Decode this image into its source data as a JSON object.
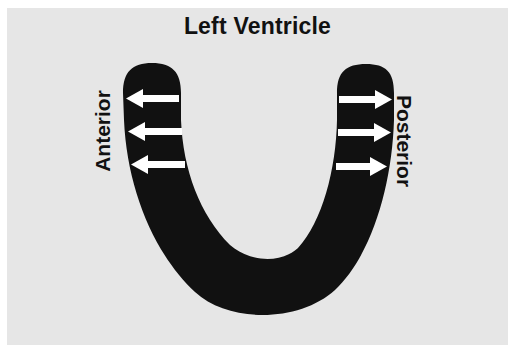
{
  "title": "Left Ventricle",
  "labels": {
    "left": "Anterior",
    "right": "Posterior"
  },
  "colors": {
    "background": "#e6e6e6",
    "border": "#ffffff",
    "wall": "#111111",
    "arrow": "#ffffff",
    "text": "#111111"
  },
  "arrows": {
    "left_direction": "left",
    "right_direction": "right",
    "count_per_side": 3
  }
}
